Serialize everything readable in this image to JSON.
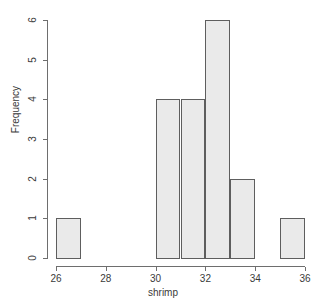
{
  "chart_data": {
    "type": "bar",
    "subtype": "histogram",
    "title": "",
    "xlabel": "shrimp",
    "ylabel": "Frequency",
    "xlim": [
      26,
      36
    ],
    "ylim": [
      0,
      6
    ],
    "grid": false,
    "legend": null,
    "bin_width": 1,
    "bin_edges": [
      26,
      27,
      28,
      29,
      30,
      31,
      32,
      33,
      34,
      35,
      36
    ],
    "categories": [
      "26-27",
      "27-28",
      "28-29",
      "29-30",
      "30-31",
      "31-32",
      "32-33",
      "33-34",
      "34-35",
      "35-36"
    ],
    "values": [
      1,
      0,
      0,
      0,
      4,
      4,
      6,
      2,
      0,
      1
    ],
    "bars": [
      {
        "x0": 26,
        "x1": 27,
        "height": 1
      },
      {
        "x0": 30,
        "x1": 31,
        "height": 4
      },
      {
        "x0": 31,
        "x1": 32,
        "height": 4
      },
      {
        "x0": 32,
        "x1": 33,
        "height": 6
      },
      {
        "x0": 33,
        "x1": 34,
        "height": 2
      },
      {
        "x0": 35,
        "x1": 36,
        "height": 1
      }
    ],
    "xticks": [
      26,
      28,
      30,
      32,
      34,
      36
    ],
    "xtick_labels": [
      "26",
      "28",
      "30",
      "32",
      "34",
      "36"
    ],
    "yticks": [
      0,
      1,
      2,
      3,
      4,
      5,
      6
    ],
    "ytick_labels": [
      "0",
      "1",
      "2",
      "3",
      "4",
      "5",
      "6"
    ],
    "total_count": 18,
    "colors": {
      "bar_fill": "#eaeaea",
      "bar_stroke": "#5e5e5e",
      "axis": "#6e6e6e",
      "text": "#3a3a3a",
      "background": "#ffffff"
    }
  }
}
